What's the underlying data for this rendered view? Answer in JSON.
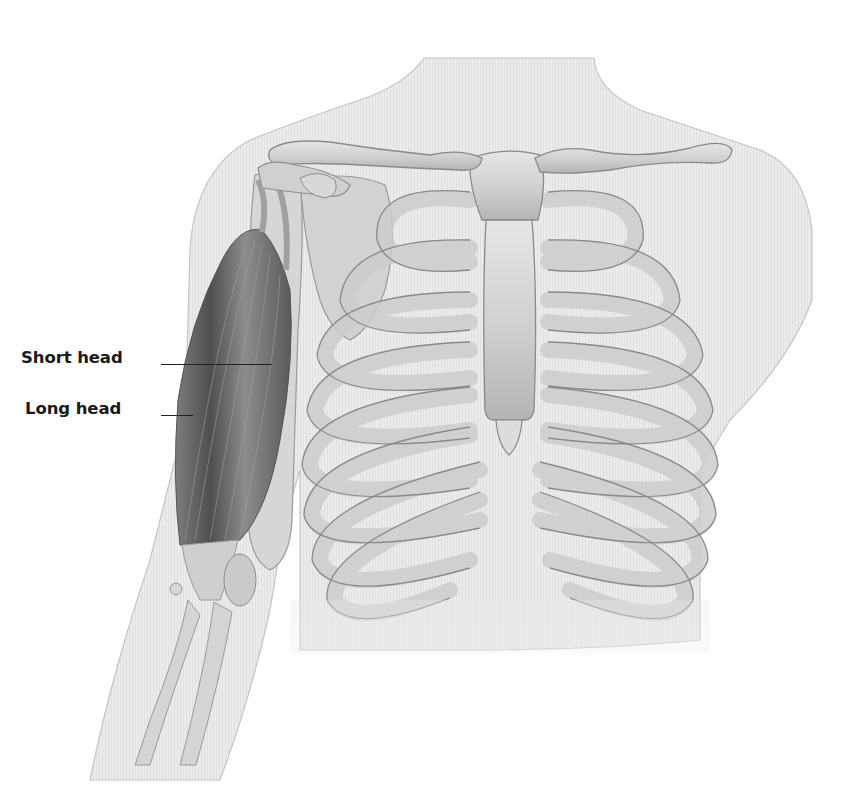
{
  "figure": {
    "labels": [
      {
        "id": "short_head",
        "text": "Short head",
        "x": 21,
        "y": 348,
        "line": {
          "x1": 161,
          "y1": 364,
          "x2": 272
        }
      },
      {
        "id": "long_head",
        "text": "Long head",
        "x": 25,
        "y": 399,
        "line": {
          "x1": 161,
          "y1": 415,
          "x2": 193
        }
      }
    ],
    "colors": {
      "background": "#ffffff",
      "body_silhouette": "#e9e9e9",
      "body_outline": "#bdbdbd",
      "bone_fill": "#d4d4d4",
      "bone_outline": "#8e8e8e",
      "cartilage_fill": "#dcdcdc",
      "muscle_dark": "#5e5e5e",
      "muscle_mid": "#8a8a8a",
      "label_text": "#1a1a1a"
    }
  }
}
